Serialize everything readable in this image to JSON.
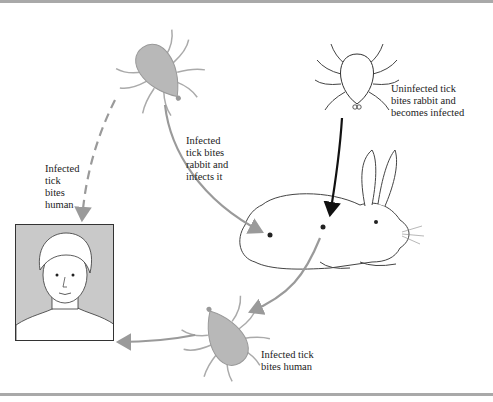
{
  "figure": {
    "colors": {
      "infected_tick_fill": "#b8b8b8",
      "arrow_gray": "#9a9a9a",
      "arrow_black": "#111111",
      "portrait_bg": "#c9c9c9",
      "frame_bar": "#a9a9a9"
    }
  },
  "nodes": {
    "infected_tick_top": {
      "label": "Infected tick (engorged, gray)"
    },
    "uninfected_tick": {
      "label": "Uninfected tick (outline)"
    },
    "rabbit": {
      "label": "Rabbit"
    },
    "infected_tick_bottom": {
      "label": "Infected tick (engorged, gray)"
    },
    "human": {
      "label": "Human"
    }
  },
  "labels": {
    "uninfected_tick_bites_rabbit": "Uninfected tick\nbites rabbit and\nbecomes infected",
    "infected_tick_bites_rabbit": "Infected\ntick bites\nrabbit and\ninfects it",
    "infected_tick_bites_human_dashed": "Infected\ntick\nbites\nhuman",
    "infected_tick_bites_human_bottom": "Infected tick\nbites human"
  },
  "edges": [
    {
      "from": "uninfected_tick",
      "to": "rabbit",
      "style": "solid",
      "color": "black"
    },
    {
      "from": "infected_tick_top",
      "to": "rabbit",
      "style": "solid",
      "color": "gray"
    },
    {
      "from": "infected_tick_top",
      "to": "human",
      "style": "dashed",
      "color": "gray"
    },
    {
      "from": "rabbit",
      "to": "infected_tick_bottom",
      "style": "solid",
      "color": "gray"
    },
    {
      "from": "infected_tick_bottom",
      "to": "human",
      "style": "solid",
      "color": "gray"
    }
  ]
}
